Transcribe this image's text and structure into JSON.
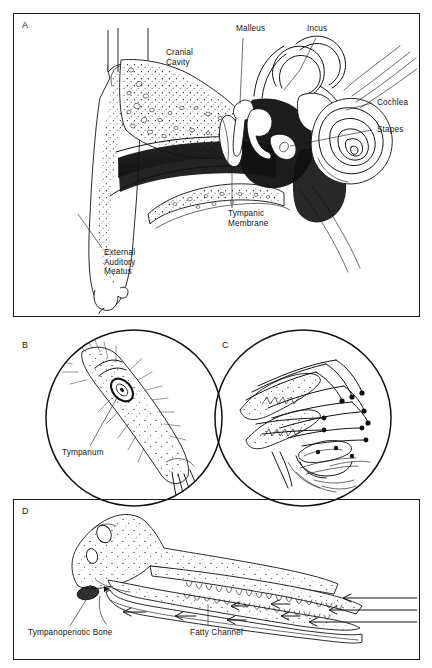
{
  "figure": {
    "background_color": "#ffffff",
    "ink_color": "#111111",
    "panel_count": 4
  },
  "panels": [
    {
      "id": "A",
      "letter": "A",
      "shape": "rectangle",
      "subject": "Human ear cross-section",
      "labels": [
        {
          "name": "malleus",
          "text": "Malleus",
          "x": 236,
          "y": 28,
          "lines": [
            "Malleus"
          ]
        },
        {
          "name": "incus",
          "text": "Incus",
          "x": 307,
          "y": 28,
          "lines": [
            "Incus"
          ]
        },
        {
          "name": "cranial-cavity",
          "text": "Cranial Cavity",
          "x": 166,
          "y": 52,
          "lines": [
            "Cranial",
            "Cavity"
          ]
        },
        {
          "name": "cochlea",
          "text": "Cochlea",
          "x": 377,
          "y": 100,
          "lines": [
            "Cochlea"
          ]
        },
        {
          "name": "stapes",
          "text": "Stapes",
          "x": 377,
          "y": 127,
          "lines": [
            "Stapes"
          ]
        },
        {
          "name": "tympanic-membrane",
          "text": "Tympanic Membrane",
          "x": 228,
          "y": 212,
          "lines": [
            "Tympanic",
            "Membrane"
          ]
        },
        {
          "name": "external-auditory-meatus",
          "text": "External Auditory Meatus",
          "x": 104,
          "y": 251,
          "lines": [
            "External",
            "Auditory",
            "Meatus"
          ]
        }
      ]
    },
    {
      "id": "B",
      "letter": "B",
      "shape": "circle",
      "subject": "Insect foreleg with tympanum",
      "labels": [
        {
          "name": "tympanum",
          "text": "Tympanum",
          "x": 62,
          "y": 450,
          "lines": [
            "Tympanum"
          ]
        }
      ]
    },
    {
      "id": "C",
      "letter": "C",
      "shape": "circle",
      "subject": "Sensory hairs and sensilla",
      "labels": []
    },
    {
      "id": "D",
      "letter": "D",
      "shape": "rectangle",
      "subject": "Dolphin skull with fatty sound channel",
      "labels": [
        {
          "name": "tympanoperiotic-bone",
          "text": "Tympanoperiotic Bone",
          "x": 28,
          "y": 630,
          "lines": [
            "Tympanoperiotic Bone"
          ]
        },
        {
          "name": "fatty-channel",
          "text": "Fatty Channel",
          "x": 190,
          "y": 630,
          "lines": [
            "Fatty Channel"
          ]
        }
      ],
      "sound_path_arrow_count": 3,
      "return_arrow_count": 6
    }
  ]
}
